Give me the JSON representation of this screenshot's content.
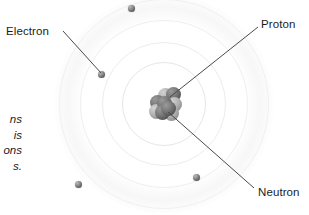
{
  "diagram": {
    "background_color": "#ffffff",
    "center": {
      "x": 164,
      "y": 104
    }
  },
  "labels": {
    "electron": "Electron",
    "proton": "Proton",
    "neutron": "Neutron"
  },
  "caption": {
    "line1": "ns",
    "line2": "is",
    "line3": "ons",
    "line4": "s."
  },
  "shells": [
    {
      "name": "shell-1",
      "radius": 42
    },
    {
      "name": "shell-2",
      "radius": 62
    },
    {
      "name": "shell-3",
      "radius": 84
    },
    {
      "name": "shell-4",
      "radius": 105
    }
  ],
  "electrons": [
    {
      "name": "electron-top",
      "x": 131,
      "y": 8
    },
    {
      "name": "electron-upper-left",
      "x": 101,
      "y": 74
    },
    {
      "name": "electron-bottom-left",
      "x": 78,
      "y": 184
    },
    {
      "name": "electron-bottom-right",
      "x": 196,
      "y": 177
    }
  ],
  "nucleus": {
    "name": "nucleus",
    "proton_count": 5,
    "neutron_count": 4,
    "particles": [
      {
        "type": "proton",
        "x": 2,
        "y": 9
      },
      {
        "type": "neutron",
        "x": 10,
        "y": 2
      },
      {
        "type": "proton",
        "x": 18,
        "y": 1
      },
      {
        "type": "neutron",
        "x": 1,
        "y": 18
      },
      {
        "type": "proton",
        "x": 9,
        "y": 10
      },
      {
        "type": "neutron",
        "x": 19,
        "y": 11
      },
      {
        "type": "proton",
        "x": 7,
        "y": 19
      },
      {
        "type": "neutron",
        "x": 16,
        "y": 20
      },
      {
        "type": "proton",
        "x": 13,
        "y": 15
      }
    ]
  },
  "leaders": [
    {
      "name": "leader-electron",
      "x1": 63,
      "y1": 31,
      "x2": 101,
      "y2": 73
    },
    {
      "name": "leader-proton",
      "x1": 258,
      "y1": 27,
      "x2": 170,
      "y2": 97
    },
    {
      "name": "leader-neutron",
      "x1": 168,
      "y1": 112,
      "x2": 254,
      "y2": 188
    }
  ],
  "colors": {
    "line": "#4a4a4a",
    "text": "#1c1c1c",
    "shell": "#a0a0a0",
    "proton": "#5a5a5a",
    "neutron": "#b5b5b5"
  }
}
